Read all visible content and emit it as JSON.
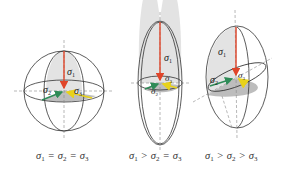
{
  "figure": {
    "colors": {
      "sigma1_arrow": "#e0452a",
      "sigma2_arrow": "#2e8b57",
      "sigma3_arrow": "#e8d21a",
      "outline": "#333333",
      "fill": "#e3e3e3",
      "fill_dark": "#bdbdbd",
      "axis": "#888888"
    },
    "panels": [
      {
        "id": "sphere",
        "labels": {
          "s1": "σ",
          "s1_sub": "1",
          "s2": "σ",
          "s2_sub": "2",
          "s3": "σ",
          "s3_sub": "3"
        },
        "caption": [
          {
            "sym": "σ",
            "sub": "1"
          },
          {
            "op": "="
          },
          {
            "sym": "σ",
            "sub": "2"
          },
          {
            "op": "="
          },
          {
            "sym": "σ",
            "sub": "3"
          }
        ]
      },
      {
        "id": "prolate",
        "labels": {
          "s1": "σ",
          "s1_sub": "1",
          "s2": "σ",
          "s2_sub": "2",
          "s3": "σ",
          "s3_sub": "3"
        },
        "caption": [
          {
            "sym": "σ",
            "sub": "1"
          },
          {
            "op": ">"
          },
          {
            "sym": "σ",
            "sub": "2"
          },
          {
            "op": "="
          },
          {
            "sym": "σ",
            "sub": "3"
          }
        ]
      },
      {
        "id": "triaxial",
        "labels": {
          "s1": "σ",
          "s1_sub": "1",
          "s2": "σ",
          "s2_sub": "2",
          "s3": "σ",
          "s3_sub": "3"
        },
        "caption": [
          {
            "sym": "σ",
            "sub": "1"
          },
          {
            "op": ">"
          },
          {
            "sym": "σ",
            "sub": "2"
          },
          {
            "op": ">"
          },
          {
            "sym": "σ",
            "sub": "3"
          }
        ]
      }
    ]
  }
}
